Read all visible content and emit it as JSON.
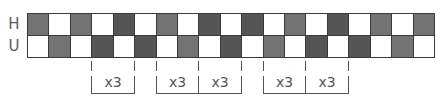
{
  "diagram": {
    "row_labels": [
      "H",
      "U"
    ],
    "columns": 19,
    "grid": {
      "left": 27,
      "top": 13,
      "width": 407,
      "row_height": 22,
      "colors": {
        "white": "#ffffff",
        "mid": "#737373",
        "dark": "#555555",
        "border": "#3a3a3a"
      },
      "rows": [
        [
          "mid",
          "white",
          "mid",
          "white",
          "dark",
          "white",
          "mid",
          "white",
          "dark",
          "white",
          "dark",
          "white",
          "mid",
          "white",
          "dark",
          "white",
          "mid",
          "white",
          "mid"
        ],
        [
          "white",
          "mid",
          "white",
          "dark",
          "white",
          "dark",
          "white",
          "mid",
          "white",
          "dark",
          "white",
          "mid",
          "white",
          "dark",
          "white",
          "dark",
          "white",
          "mid",
          "white"
        ]
      ]
    },
    "brackets": [
      {
        "start_col": 3,
        "end_col": 5,
        "label": "x3"
      },
      {
        "start_col": 6,
        "end_col": 8,
        "label": "x3"
      },
      {
        "start_col": 8,
        "end_col": 10,
        "label": "x3"
      },
      {
        "start_col": 11,
        "end_col": 13,
        "label": "x3"
      },
      {
        "start_col": 13,
        "end_col": 15,
        "label": "x3"
      }
    ]
  }
}
